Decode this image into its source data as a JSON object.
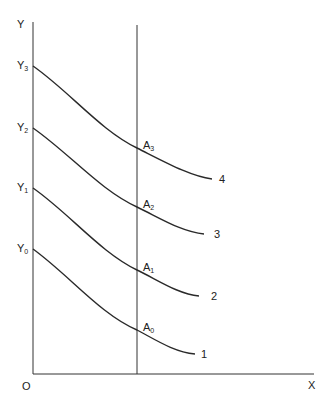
{
  "diagram": {
    "axes": {
      "y_label": "Y",
      "x_label": "X",
      "origin_label": "O"
    },
    "y_intercepts": [
      {
        "base": "Y",
        "sub": "0"
      },
      {
        "base": "Y",
        "sub": "1"
      },
      {
        "base": "Y",
        "sub": "2"
      },
      {
        "base": "Y",
        "sub": "3"
      }
    ],
    "intersection_points": [
      {
        "base": "A",
        "sub": "0"
      },
      {
        "base": "A",
        "sub": "1"
      },
      {
        "base": "A",
        "sub": "2"
      },
      {
        "base": "A",
        "sub": "3"
      }
    ],
    "curve_labels": [
      "1",
      "2",
      "3",
      "4"
    ],
    "line_color": "#2a2a2a",
    "background": "#ffffff"
  }
}
